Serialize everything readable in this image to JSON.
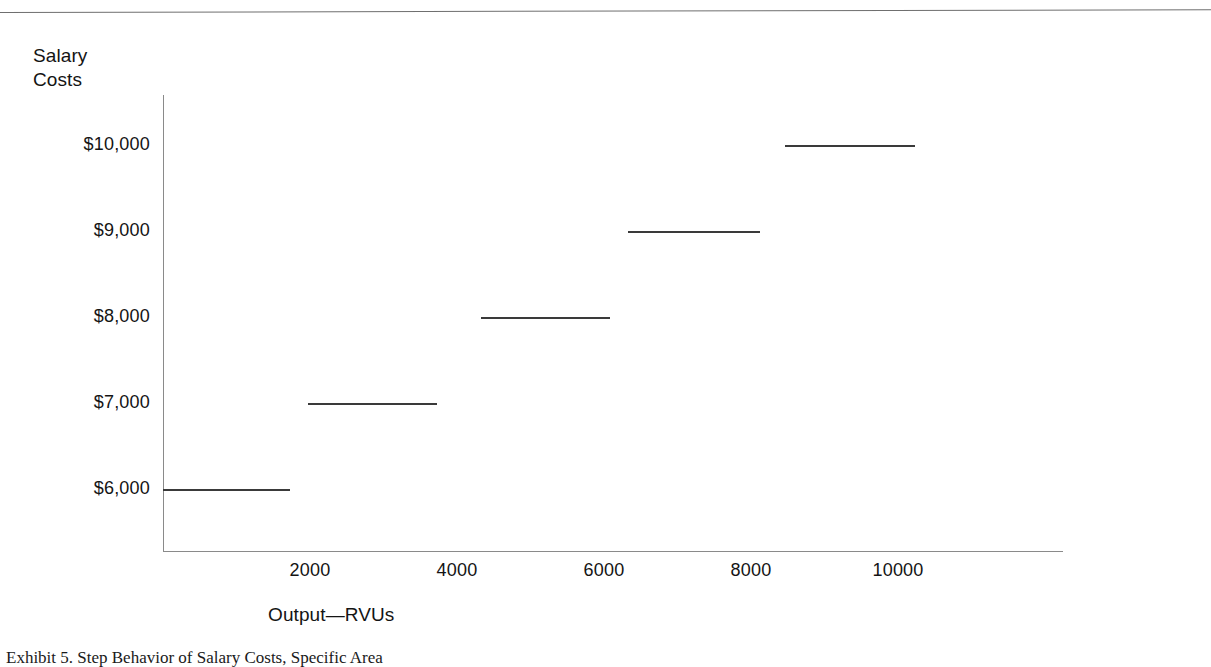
{
  "figure": {
    "caption": "Exhibit 5. Step Behavior of Salary Costs, Specific Area",
    "top_rule": "horizontal-rule"
  },
  "chart_data": {
    "type": "line",
    "subtype": "step-function",
    "title": "",
    "xlabel": "Output—RVUs",
    "ylabel": "Salary\nCosts",
    "ylabel_lines": [
      "Salary",
      "Costs"
    ],
    "x_tick_labels": [
      "2000",
      "4000",
      "6000",
      "8000",
      "10000"
    ],
    "x_tick_values": [
      2000,
      4000,
      6000,
      8000,
      10000
    ],
    "y_tick_labels": [
      "$10,000",
      "$9,000",
      "$8,000",
      "$7,000",
      "$6,000"
    ],
    "y_tick_values": [
      10000,
      9000,
      8000,
      7000,
      6000
    ],
    "xlim": [
      0,
      12245
    ],
    "ylim": [
      5100,
      10500
    ],
    "grid": false,
    "legend": null,
    "line_color": "#3a3a3a",
    "axis_color": "#8a8a8a",
    "steps": [
      {
        "label": "$6,000",
        "value": 6000,
        "x_start": 0,
        "x_end": 1727
      },
      {
        "label": "$7,000",
        "value": 7000,
        "x_start": 1973,
        "x_end": 3728
      },
      {
        "label": "$8,000",
        "value": 8000,
        "x_start": 4326,
        "x_end": 6082
      },
      {
        "label": "$9,000",
        "value": 9000,
        "x_start": 6327,
        "x_end": 8122
      },
      {
        "label": "$10,000",
        "value": 10000,
        "x_start": 8463,
        "x_end": 10232
      }
    ]
  }
}
